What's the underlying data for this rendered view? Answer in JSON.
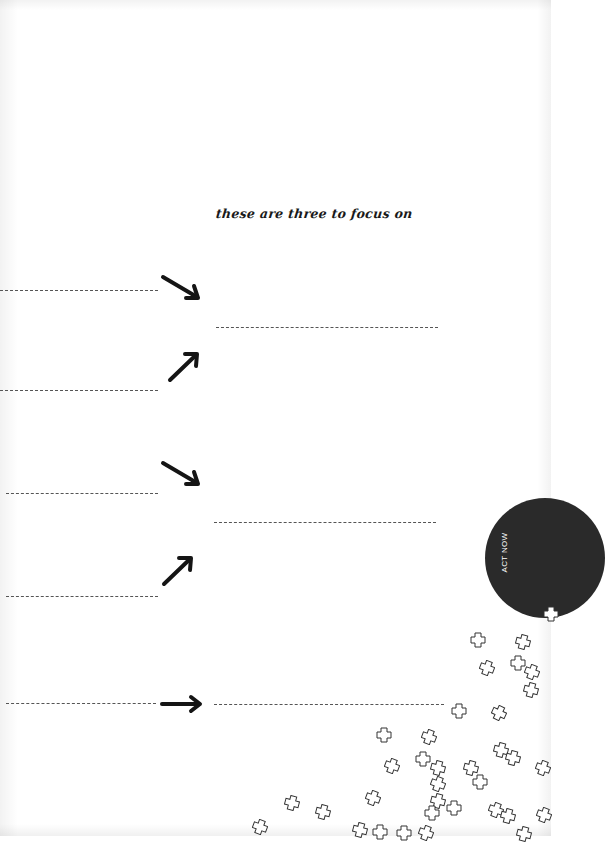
{
  "worksheet": {
    "heading": "these are three to focus on",
    "badge": {
      "label": "ACT NOW",
      "color": "#2a2a2a"
    },
    "input_lines": {
      "left": 5,
      "right": 3
    },
    "arrows": [
      "down-right",
      "up-right",
      "down-right",
      "up-right",
      "right"
    ]
  }
}
